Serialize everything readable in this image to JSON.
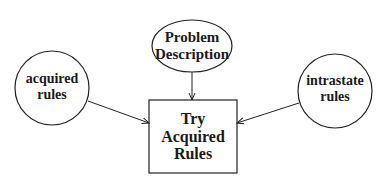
{
  "diagram": {
    "nodes": {
      "problem": {
        "shape": "ellipse",
        "line1": "Problem",
        "line2": "Description"
      },
      "acquired": {
        "shape": "circle",
        "line1": "acquired",
        "line2": "rules"
      },
      "intrastate": {
        "shape": "circle",
        "line1": "intrastate",
        "line2": "rules"
      },
      "try": {
        "shape": "rectangle",
        "line1": "Try",
        "line2": "Acquired",
        "line3": "Rules"
      }
    },
    "edges": [
      {
        "from": "problem",
        "to": "try"
      },
      {
        "from": "acquired",
        "to": "try"
      },
      {
        "from": "intrastate",
        "to": "try"
      }
    ],
    "colors": {
      "stroke": "#222222",
      "text": "#1a1a1a",
      "background": "#ffffff"
    }
  }
}
